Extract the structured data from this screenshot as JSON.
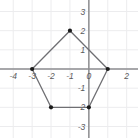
{
  "figure": {
    "name": "pentagon-on-coordinate-plane",
    "background_color": "#ffffff",
    "width": 138,
    "height": 138
  },
  "chart_data": {
    "type": "scatter",
    "title": "",
    "subtitle": "",
    "xlabel": "",
    "ylabel": "",
    "xlim": [
      -4.7,
      2.6
    ],
    "ylim": [
      -3.6,
      3.6
    ],
    "grid": true,
    "grid_color": "#ececee",
    "grid_spacing": 1,
    "legend": "none",
    "axis_color": "#8d8d90",
    "x_axis_y": 0,
    "y_axis_x": 0,
    "xticks": [
      -4,
      -3,
      -2,
      -1,
      0,
      2
    ],
    "xtick_labels": [
      "-4",
      "-3",
      "-2",
      "-1",
      "0",
      "2"
    ],
    "yticks": [
      3,
      2,
      1,
      -1,
      -2,
      -3
    ],
    "ytick_labels": [
      "3",
      "2",
      "1",
      "-1",
      "-2",
      "-3"
    ],
    "shape": {
      "name": "pentagon",
      "closed": true,
      "stroke_color": "#6f6f73",
      "stroke_width": 1.3,
      "fill": "none",
      "vertex_marker": "filled-circle",
      "vertex_color": "#1b1b1b",
      "vertex_radius": 2.1,
      "vertices": [
        {
          "label": "A",
          "x": -1,
          "y": 2
        },
        {
          "label": "B",
          "x": 1,
          "y": 0
        },
        {
          "label": "C",
          "x": 0,
          "y": -2
        },
        {
          "label": "D",
          "x": -2,
          "y": -2
        },
        {
          "label": "E",
          "x": -3,
          "y": 0
        }
      ]
    }
  }
}
